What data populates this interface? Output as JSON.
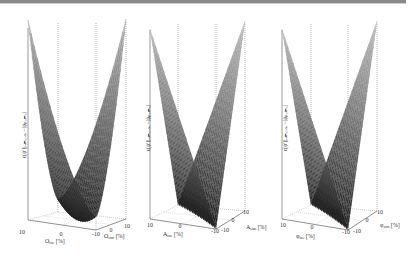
{
  "chart_data": [
    {
      "type": "surface3d",
      "title": "",
      "xlabel": "O_ine [%]",
      "ylabel": "O_sim [%]",
      "zlabel": "ϵ(ψ′)|_{OEMcase} −|ψ_{PCMC}|",
      "x_ticks": [
        "10",
        "0",
        "-10"
      ],
      "y_ticks": [
        "-10",
        "0",
        "10"
      ],
      "xlim": [
        -10,
        10
      ],
      "ylim": [
        -10,
        10
      ],
      "shape": "curved-v (quadratic-like valley, min at x=y)",
      "colormap": "gray",
      "grid": true
    },
    {
      "type": "surface3d",
      "title": "",
      "xlabel": "A_ine [%]",
      "ylabel": "A_sim [%]",
      "zlabel": "ϵ(ψ′)|_{OEMcase} −|ψ_{PCMC}|",
      "x_ticks": [
        "10",
        "0",
        "-10"
      ],
      "y_ticks": [
        "-10",
        "0",
        "10"
      ],
      "xlim": [
        -10,
        10
      ],
      "ylim": [
        -10,
        10
      ],
      "shape": "linear-v (|x−y|, min along diagonal)",
      "colormap": "gray",
      "grid": true
    },
    {
      "type": "surface3d",
      "title": "",
      "xlabel": "φ_ine [%]",
      "ylabel": "φ_sim [%]",
      "zlabel": "ϵ(ψ′)|_{OEMcase} −|ψ_{PCMC}|",
      "x_ticks": [
        "10",
        "0",
        "-10"
      ],
      "y_ticks": [
        "-10",
        "0",
        "10"
      ],
      "xlim": [
        -10,
        10
      ],
      "ylim": [
        -10,
        10
      ],
      "shape": "linear-v (|x−y|, min along diagonal)",
      "colormap": "gray",
      "grid": true
    }
  ],
  "panels": [
    {
      "zlabel": "ϵ(ψ′)|ₒₑₘ꜀ₐₛₑ −|ψₚ꜀ₘ꜀|",
      "xlabel": "O",
      "xsub": "ine",
      "xunit": " [%]",
      "ylabel": "O",
      "ysub": "sim",
      "yunit": " [%]",
      "xt0": "10",
      "xt1": "0",
      "xt2": "-10",
      "yt0": "-10",
      "yt1": "0",
      "yt2": "10"
    },
    {
      "zlabel": "ϵ(ψ′)|ₒₑₘ꜀ₐₛₑ −|ψₚ꜀ₘ꜀|",
      "xlabel": "A",
      "xsub": "ine",
      "xunit": " [%]",
      "ylabel": "A",
      "ysub": "sim",
      "yunit": " [%]",
      "xt0": "10",
      "xt1": "0",
      "xt2": "-10",
      "yt0": "-10",
      "yt1": "0",
      "yt2": "10"
    },
    {
      "zlabel": "ϵ(ψ′)|ₒₑₘ꜀ₐₛₑ −|ψₚ꜀ₘ꜀|",
      "xlabel": "φ",
      "xsub": "ine",
      "xunit": " [%]",
      "ylabel": "φ",
      "ysub": "sim",
      "yunit": " [%]",
      "xt0": "10",
      "xt1": "0",
      "xt2": "-10",
      "yt0": "-10",
      "yt1": "0",
      "yt2": "10"
    }
  ]
}
